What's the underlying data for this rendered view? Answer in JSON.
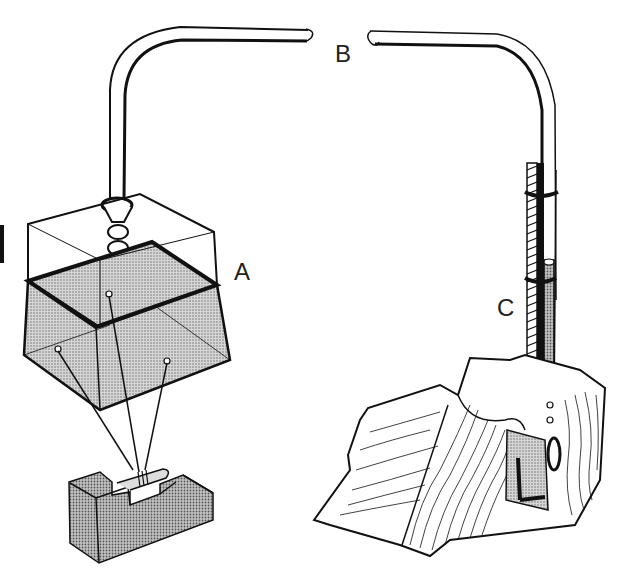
{
  "diagram": {
    "type": "technical-illustration",
    "labels": {
      "a": "A",
      "b": "B",
      "c": "C"
    },
    "components": [
      {
        "id": "A",
        "description": "Shaded trapezoidal reservoir container with connector fitting at top, suspended by three wires from a notched block"
      },
      {
        "id": "B",
        "description": "Curved tube, broken at the middle (label B between the two open ends)"
      },
      {
        "id": "C",
        "description": "Graduated tube with clamps, strapped and inserted into a wooden stump with a hook/clip"
      }
    ],
    "colors": {
      "line": "#111111",
      "shade": "#b8b8b8",
      "background": "#ffffff"
    }
  }
}
